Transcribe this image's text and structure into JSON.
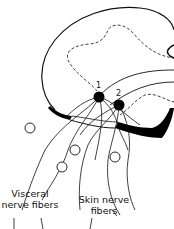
{
  "diagram": {
    "type": "anatomical-illustration",
    "neurons": [
      {
        "id": "1",
        "label": "1"
      },
      {
        "id": "2",
        "label": "2"
      }
    ],
    "labels": {
      "visceral_line1": "Visceral",
      "visceral_line2": "nerve fibers",
      "skin_line1": "Skin nerve",
      "skin_line2": "fibers"
    },
    "colors": {
      "stroke": "#111111",
      "fill_dark": "#000000",
      "background": "#ffffff"
    }
  }
}
